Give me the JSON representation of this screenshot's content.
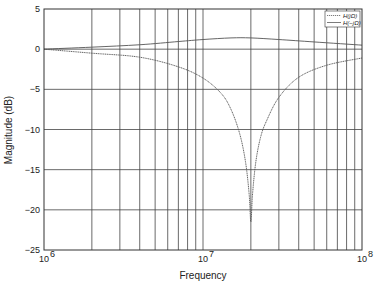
{
  "chart_data": {
    "type": "line",
    "title": "",
    "xlabel": "Frequency",
    "ylabel": "Magnitude (dB)",
    "xscale": "log",
    "xlim": [
      1000000,
      100000000
    ],
    "ylim": [
      -25,
      5
    ],
    "grid": true,
    "x_tick_labels": [
      {
        "base": "10",
        "exp": "6",
        "value": 1000000
      },
      {
        "base": "10",
        "exp": "7",
        "value": 10000000
      },
      {
        "base": "10",
        "exp": "8",
        "value": 100000000
      }
    ],
    "y_ticks": [
      5,
      0,
      -5,
      -10,
      -15,
      -20,
      -25
    ],
    "y_tick_labels": [
      "5",
      "0",
      "−5",
      "−10",
      "−15",
      "−20",
      "−25"
    ],
    "legend_position": "upper right",
    "series": [
      {
        "name": "H(jΩ)",
        "style": "dashed",
        "x": [
          1000000,
          2000000,
          4000000,
          7000000,
          10000000,
          13000000,
          15000000,
          17000000,
          18500000,
          19500000,
          20000000,
          20500000,
          21500000,
          23000000,
          25000000,
          30000000,
          40000000,
          60000000,
          100000000
        ],
        "values": [
          0.0,
          -0.5,
          -1.0,
          -2.2,
          -3.6,
          -5.5,
          -7.5,
          -10.5,
          -14.0,
          -18.0,
          -21.5,
          -18.0,
          -14.0,
          -11.0,
          -9.0,
          -6.0,
          -3.5,
          -2.0,
          -1.1
        ]
      },
      {
        "name": "H(−jΩ)",
        "style": "solid",
        "x": [
          1000000,
          2000000,
          4000000,
          7000000,
          10000000,
          15000000,
          20000000,
          30000000,
          50000000,
          100000000
        ],
        "values": [
          0.0,
          0.25,
          0.55,
          0.95,
          1.2,
          1.4,
          1.4,
          1.2,
          0.9,
          0.5
        ]
      }
    ]
  }
}
